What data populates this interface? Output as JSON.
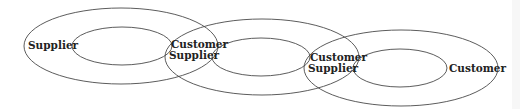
{
  "diagram": {
    "type": "overlapping-nested-ellipses",
    "stroke_color": "#4a4a4a",
    "text_color": "#222222",
    "nodes": [
      {
        "id": "entity-1",
        "outer": {
          "cx": 121,
          "cy": 46,
          "rx": 97,
          "ry": 38
        },
        "inner": {
          "cx": 122,
          "cy": 46,
          "rx": 50,
          "ry": 19
        },
        "labels": [
          {
            "text": "Supplier",
            "x": 28,
            "y": 49
          }
        ]
      },
      {
        "id": "entity-2",
        "outer": {
          "cx": 262,
          "cy": 57,
          "rx": 97,
          "ry": 38
        },
        "inner": {
          "cx": 261,
          "cy": 57,
          "rx": 49,
          "ry": 19
        },
        "labels": [
          {
            "text": "Customer",
            "x": 171,
            "y": 48
          },
          {
            "text": "Supplier",
            "x": 169,
            "y": 59
          }
        ]
      },
      {
        "id": "entity-3",
        "outer": {
          "cx": 401,
          "cy": 68,
          "rx": 97,
          "ry": 38
        },
        "inner": {
          "cx": 400,
          "cy": 68,
          "rx": 47,
          "ry": 19
        },
        "labels": [
          {
            "text": "Customer",
            "x": 310,
            "y": 61
          },
          {
            "text": "Supplier",
            "x": 308,
            "y": 72
          }
        ]
      }
    ],
    "end_label": {
      "text": "Customer",
      "x": 449,
      "y": 72
    }
  }
}
